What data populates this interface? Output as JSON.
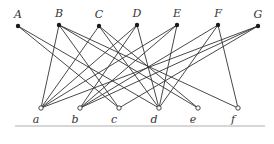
{
  "diagram": {
    "type": "bipartite-graph",
    "top_nodes": [
      {
        "id": "A",
        "label": "A",
        "x": 18,
        "y": 26
      },
      {
        "id": "B",
        "label": "B",
        "x": 59,
        "y": 25
      },
      {
        "id": "C",
        "label": "C",
        "x": 99,
        "y": 26
      },
      {
        "id": "D",
        "label": "D",
        "x": 137,
        "y": 25
      },
      {
        "id": "E",
        "label": "E",
        "x": 177,
        "y": 25
      },
      {
        "id": "F",
        "label": "F",
        "x": 218,
        "y": 25
      },
      {
        "id": "G",
        "label": "G",
        "x": 258,
        "y": 26
      }
    ],
    "bottom_nodes": [
      {
        "id": "a",
        "label": "a",
        "x": 41,
        "y": 108
      },
      {
        "id": "b",
        "label": "b",
        "x": 80,
        "y": 108
      },
      {
        "id": "c",
        "label": "c",
        "x": 119,
        "y": 108
      },
      {
        "id": "d",
        "label": "d",
        "x": 159,
        "y": 108
      },
      {
        "id": "e",
        "label": "e",
        "x": 198,
        "y": 108
      },
      {
        "id": "f",
        "label": "f",
        "x": 238,
        "y": 108
      }
    ],
    "edges": [
      [
        "A",
        "c"
      ],
      [
        "A",
        "d"
      ],
      [
        "B",
        "a"
      ],
      [
        "B",
        "c"
      ],
      [
        "B",
        "e"
      ],
      [
        "B",
        "f"
      ],
      [
        "C",
        "a"
      ],
      [
        "C",
        "d"
      ],
      [
        "C",
        "e"
      ],
      [
        "D",
        "a"
      ],
      [
        "D",
        "b"
      ],
      [
        "D",
        "d"
      ],
      [
        "E",
        "a"
      ],
      [
        "E",
        "b"
      ],
      [
        "E",
        "d"
      ],
      [
        "F",
        "b"
      ],
      [
        "F",
        "d"
      ],
      [
        "F",
        "f"
      ],
      [
        "G",
        "a"
      ],
      [
        "G",
        "b"
      ],
      [
        "G",
        "c"
      ]
    ],
    "baseline": {
      "x1": 15,
      "x2": 265,
      "y": 126
    }
  }
}
